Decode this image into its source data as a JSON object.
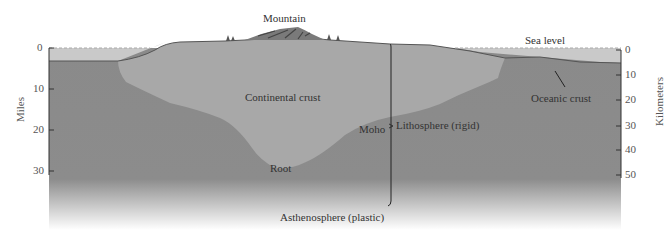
{
  "labels": {
    "mountain": "Mountain",
    "sea_level": "Sea level",
    "continental_crust": "Continental crust",
    "oceanic_crust": "Oceanic crust",
    "root": "Root",
    "moho": "Moho",
    "lithosphere": "Lithosphere (rigid)",
    "asthenosphere": "Asthenosphere (plastic)"
  },
  "axes": {
    "left": {
      "label": "Miles",
      "ticks": [
        "0",
        "10",
        "20",
        "30"
      ]
    },
    "right": {
      "label": "Kilometers",
      "ticks": [
        "0",
        "10",
        "20",
        "30",
        "40",
        "50"
      ]
    }
  },
  "colors": {
    "sea": "#c9c9c9",
    "continental_crust": "#a8a8a8",
    "mantle": "#8a8a8a",
    "outline": "#555555"
  }
}
